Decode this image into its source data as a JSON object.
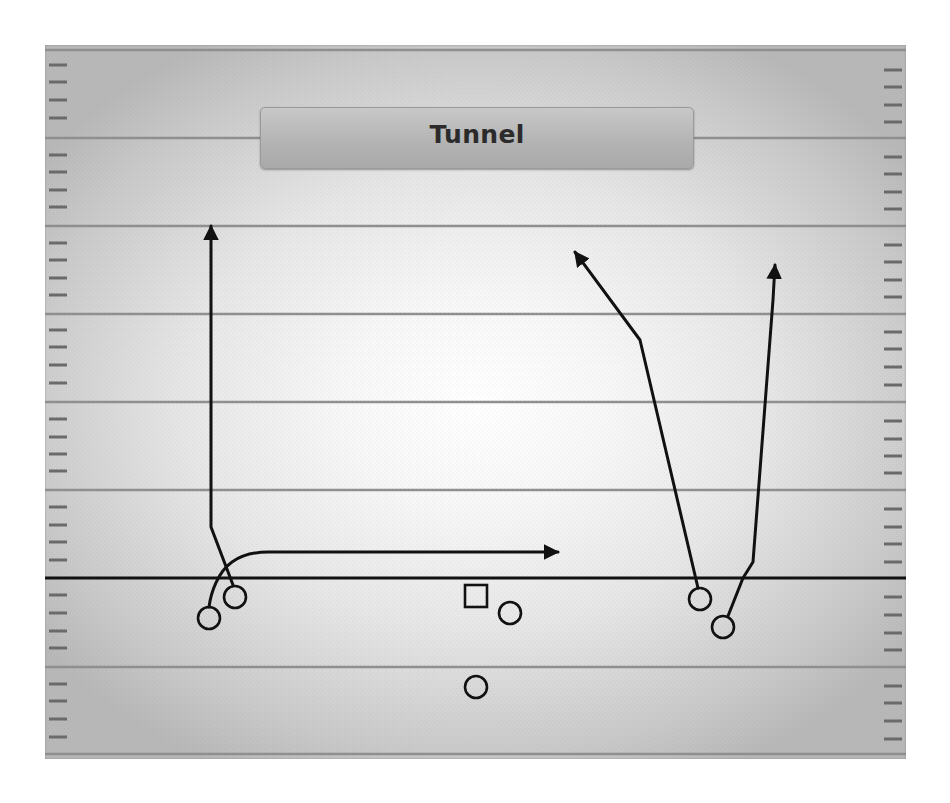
{
  "play": {
    "title": "Tunnel"
  },
  "colors": {
    "route": "#111111",
    "yard_line": "#8f8f8f",
    "hash": "#6a6a6a",
    "line_of_scrimmage": "#111111",
    "title_plate": "#b4b4b4",
    "title_text": "#2b2b2b"
  },
  "field": {
    "yard_lines_y": [
      138,
      226,
      314,
      402,
      490,
      667
    ],
    "line_of_scrimmage_y": 578,
    "hash_spacing": 17.6
  },
  "players": [
    {
      "id": "wr-left-outside",
      "shape": "circle",
      "x": 209,
      "y": 618
    },
    {
      "id": "wr-left-inside",
      "shape": "circle",
      "x": 235,
      "y": 597
    },
    {
      "id": "center",
      "shape": "square",
      "x": 476,
      "y": 596
    },
    {
      "id": "right-guard",
      "shape": "circle",
      "x": 510,
      "y": 613
    },
    {
      "id": "quarterback",
      "shape": "circle",
      "x": 476,
      "y": 687
    },
    {
      "id": "wr-right-inside",
      "shape": "circle",
      "x": 700,
      "y": 599
    },
    {
      "id": "wr-right-outside",
      "shape": "circle",
      "x": 723,
      "y": 627
    }
  ],
  "routes": [
    {
      "id": "left-go-route",
      "from": "wr-left-inside",
      "type": "vertical"
    },
    {
      "id": "left-tunnel-screen",
      "from": "wr-left-outside",
      "type": "screen"
    },
    {
      "id": "right-inside-seam",
      "from": "wr-right-inside",
      "type": "angled-vertical"
    },
    {
      "id": "right-outside-go",
      "from": "wr-right-outside",
      "type": "vertical"
    }
  ]
}
